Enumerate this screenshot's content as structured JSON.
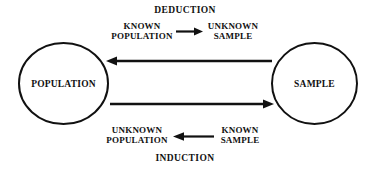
{
  "diagram": {
    "title_top": "DEDUCTION",
    "title_bottom": "INDUCTION",
    "nodes": {
      "left": "POPULATION",
      "right": "SAMPLE"
    },
    "deduction_flow": {
      "from_line1": "KNOWN",
      "from_line2": "POPULATION",
      "to_line1": "UNKNOWN",
      "to_line2": "SAMPLE",
      "arrow_direction": "right"
    },
    "induction_flow": {
      "from_line1": "KNOWN",
      "from_line2": "SAMPLE",
      "to_line1": "UNKNOWN",
      "to_line2": "POPULATION",
      "arrow_direction": "left"
    },
    "connectors": {
      "upper_arrow_direction": "left",
      "upper_arrow_from": "SAMPLE",
      "upper_arrow_to": "POPULATION",
      "lower_arrow_direction": "right",
      "lower_arrow_from": "POPULATION",
      "lower_arrow_to": "SAMPLE"
    },
    "colors": {
      "stroke": "#111111",
      "background": "#ffffff",
      "text": "#111111"
    }
  }
}
